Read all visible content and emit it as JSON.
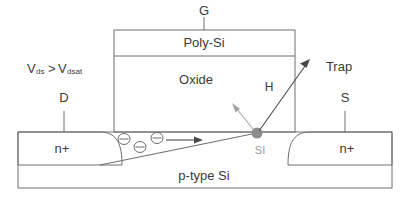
{
  "diagram": {
    "labels": {
      "gate": "G",
      "poly_si": "Poly-Si",
      "oxide": "Oxide",
      "drain_terminal": "D",
      "source_terminal": "S",
      "bias_v": "V",
      "bias_sub1": "ds",
      "bias_gt": ">",
      "bias_v2": "V",
      "bias_sub2": "dsat",
      "bias_full": "Vds>Vdsat",
      "n_plus_left": "n+",
      "n_plus_right": "n+",
      "substrate": "p-type Si",
      "trap": "Trap",
      "hydrogen": "H",
      "si_site": "SI"
    },
    "icons": {
      "electron_1": "electron-charge-icon",
      "electron_2": "electron-charge-icon",
      "electron_3": "electron-charge-icon",
      "electron_flow": "electron-flow-arrow-icon",
      "trap_arrow": "trap-arrow-icon",
      "hydrogen_arrow": "hydrogen-release-arrow-icon",
      "si_node": "si-interface-node-icon",
      "gate_lead": "gate-lead-line",
      "drain_lead": "drain-lead-line",
      "source_lead": "source-lead-line",
      "channel_line": "depletion-channel-line"
    },
    "colors": {
      "outline": "#6e6e6e",
      "text": "#3b3b3b",
      "gray_text": "#9a9a9a",
      "node": "#8c8c8c",
      "arrow_dark": "#4a4a4a",
      "arrow_gray": "#a6a6a6",
      "background": "#ffffff"
    }
  }
}
